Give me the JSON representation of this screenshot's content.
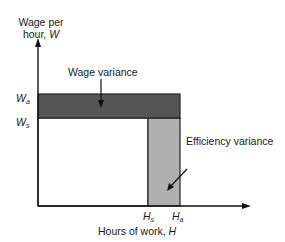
{
  "diagram": {
    "type": "variance-analysis",
    "y_axis": {
      "label_line1": "Wage per",
      "label_line2": "hour, ",
      "symbol": "W"
    },
    "x_axis": {
      "label": "Hours of work, ",
      "symbol": "H"
    },
    "y_ticks": [
      {
        "base": "W",
        "sub": "a"
      },
      {
        "base": "W",
        "sub": "s"
      }
    ],
    "x_ticks": [
      {
        "base": "H",
        "sub": "s"
      },
      {
        "base": "H",
        "sub": "a"
      }
    ],
    "regions": [
      {
        "name": "Wage variance",
        "color": "#555555"
      },
      {
        "name": "Efficiency variance",
        "color": "#b0b0b0"
      }
    ],
    "annotations": {
      "wage": "Wage variance",
      "efficiency": "Efficiency variance"
    }
  }
}
